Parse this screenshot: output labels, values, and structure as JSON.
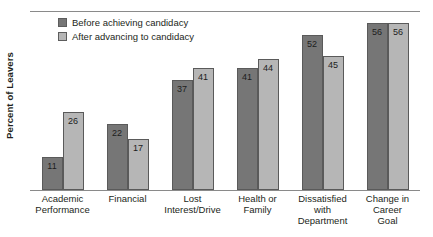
{
  "chart_data": {
    "type": "bar",
    "title": "",
    "subtitle": "",
    "xlabel": "",
    "ylabel": "Percent of Leavers",
    "ylim": [
      0,
      60
    ],
    "grid": false,
    "legend_position": "top-left",
    "categories": [
      "Academic Performance",
      "Financial",
      "Lost Interest/Drive",
      "Health or Family",
      "Dissatisfied with Department",
      "Change in Career Goal"
    ],
    "category_lines": [
      [
        "Academic",
        "Performance"
      ],
      [
        "Financial"
      ],
      [
        "Lost",
        "Interest/Drive"
      ],
      [
        "Health or",
        "Family"
      ],
      [
        "Dissatisfied",
        "with",
        "Department"
      ],
      [
        "Change in",
        "Career",
        "Goal"
      ]
    ],
    "series": [
      {
        "name": "Before achieving candidacy",
        "color": "#767676",
        "values": [
          11,
          22,
          37,
          41,
          52,
          56
        ]
      },
      {
        "name": "After advancing to candidacy",
        "color": "#b6b6b6",
        "values": [
          26,
          17,
          41,
          44,
          45,
          56
        ]
      }
    ]
  },
  "legend": {
    "items": [
      {
        "label": "Before achieving candidacy",
        "color": "#767676"
      },
      {
        "label": "After advancing to candidacy",
        "color": "#b6b6b6"
      }
    ]
  },
  "axes": {
    "y_title": "Percent of Leavers"
  }
}
